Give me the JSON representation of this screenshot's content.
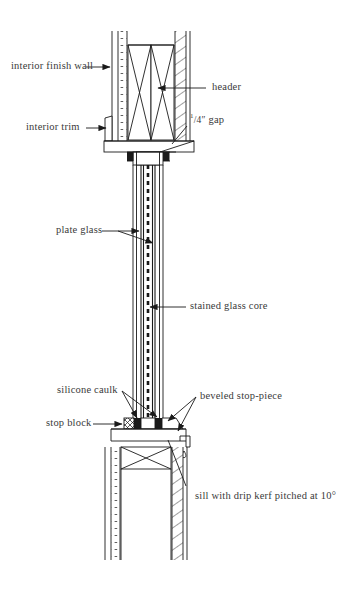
{
  "diagram": {
    "type": "architectural-section",
    "ink_color": "#1a1a1a",
    "text_color": "#3a3a3a",
    "background": "#ffffff",
    "labels": [
      {
        "id": "interior-finish-wall",
        "text": "interior finish wall"
      },
      {
        "id": "header",
        "text": "header"
      },
      {
        "id": "interior-trim",
        "text": "interior trim"
      },
      {
        "id": "quarter-gap",
        "text": "1/4″ gap",
        "numerator": "1",
        "denominator": "/4″",
        "suffix": " gap"
      },
      {
        "id": "plate-glass",
        "text": "plate glass"
      },
      {
        "id": "stained-glass-core",
        "text": "stained glass core"
      },
      {
        "id": "silicone-caulk",
        "text": "silicone caulk"
      },
      {
        "id": "beveled-stop-piece",
        "text": "beveled stop-piece"
      },
      {
        "id": "stop-block",
        "text": "stop block"
      },
      {
        "id": "sill-drip-kerf",
        "text": "sill with drip kerf pitched at 10°"
      }
    ],
    "components": {
      "header_note": "double framing member with X-bracing",
      "sill_note": "sloped sill with drip kerf",
      "glass_note": "two plate glass panes sandwiching stained glass core"
    }
  }
}
